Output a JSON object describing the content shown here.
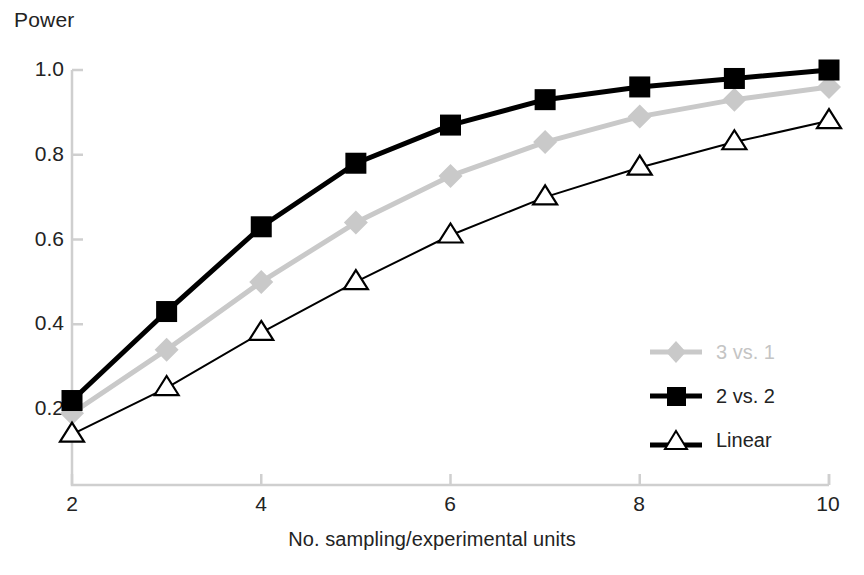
{
  "chart_data": {
    "type": "line",
    "title": "",
    "xlabel": "No. sampling/experimental units",
    "ylabel": "Power",
    "x": [
      2,
      3,
      4,
      5,
      6,
      7,
      8,
      9,
      10
    ],
    "xlim": [
      2,
      10
    ],
    "ylim": [
      0.1,
      1.04
    ],
    "xticks": [
      "2",
      "4",
      "6",
      "8",
      "10"
    ],
    "xtick_values": [
      2,
      4,
      6,
      8,
      10
    ],
    "yticks": [
      "0.2",
      "0.4",
      "0.6",
      "0.8",
      "1.0"
    ],
    "ytick_values": [
      0.2,
      0.4,
      0.6,
      0.8,
      1.0
    ],
    "grid": false,
    "legend_position": "center-right",
    "series": [
      {
        "name": "3 vs. 1",
        "marker": "diamond",
        "color": "#c9c9c9",
        "line_width": 5,
        "values": [
          0.19,
          0.34,
          0.5,
          0.64,
          0.75,
          0.83,
          0.89,
          0.93,
          0.96
        ]
      },
      {
        "name": "2 vs. 2",
        "marker": "square",
        "color": "#000000",
        "line_width": 5,
        "values": [
          0.22,
          0.43,
          0.63,
          0.78,
          0.87,
          0.93,
          0.96,
          0.98,
          1.0
        ]
      },
      {
        "name": "Linear",
        "marker": "triangle",
        "color": "#000000",
        "marker_fill": "#ffffff",
        "line_width": 2,
        "values": [
          0.14,
          0.25,
          0.38,
          0.5,
          0.61,
          0.7,
          0.77,
          0.83,
          0.88
        ]
      }
    ]
  },
  "axes": {
    "y_title": "Power",
    "x_title": "No. sampling/experimental units",
    "axis_color": "#cfcfcf",
    "y_tick_labels": [
      "1.0",
      "0.8",
      "0.6",
      "0.4",
      "0.2"
    ],
    "x_tick_labels": [
      "2",
      "4",
      "6",
      "8",
      "10"
    ]
  },
  "legend": {
    "items": [
      {
        "label": "3 vs. 1",
        "marker": "diamond-icon",
        "color": "#c9c9c9"
      },
      {
        "label": "2 vs. 2",
        "marker": "square-icon",
        "color": "#000000"
      },
      {
        "label": "Linear",
        "marker": "triangle-icon",
        "color": "#000000"
      }
    ]
  }
}
